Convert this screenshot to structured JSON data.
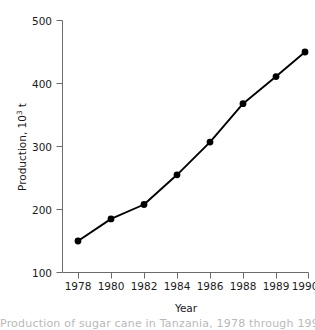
{
  "chart_data": {
    "type": "line",
    "title": "",
    "xlabel": "Year",
    "ylabel": "Production, 10",
    "ylabel_sup": "3",
    "ylabel_unit": " t",
    "x": [
      1978,
      1980,
      1982,
      1984,
      1986,
      1988,
      1989,
      1990
    ],
    "values": [
      150,
      185,
      208,
      255,
      307,
      368,
      411,
      450
    ],
    "categories": [
      "1978",
      "1980",
      "1982",
      "1984",
      "1986",
      "1988",
      "1989",
      "1990"
    ],
    "xtick_labels": [
      "1978",
      "1980",
      "1982",
      "1984",
      "1986",
      "1988",
      "1989",
      "1990"
    ],
    "ytick_labels": [
      "100",
      "200",
      "300",
      "400",
      "500"
    ],
    "ytick_values": [
      100,
      200,
      300,
      400,
      500
    ],
    "ylim": [
      100,
      500
    ],
    "grid": false,
    "legend": "none",
    "marker": "filled-circle",
    "line_color": "#000000",
    "marker_color": "#000000",
    "axis_color": "#6b6b6b",
    "background": "#ffffff"
  },
  "axes": {
    "y_title_text": "Production, 10",
    "y_title_sup": "3",
    "y_title_tail": " t",
    "x_title_text": "Year"
  },
  "ticks": {
    "y": [
      {
        "label": "500",
        "value": 500
      },
      {
        "label": "400",
        "value": 400
      },
      {
        "label": "300",
        "value": 300
      },
      {
        "label": "200",
        "value": 200
      },
      {
        "label": "100",
        "value": 100
      }
    ],
    "x": [
      {
        "label": "1978",
        "value": 1978
      },
      {
        "label": "1980",
        "value": 1980
      },
      {
        "label": "1982",
        "value": 1982
      },
      {
        "label": "1984",
        "value": 1984
      },
      {
        "label": "1986",
        "value": 1986
      },
      {
        "label": "1988",
        "value": 1988
      },
      {
        "label": "1989",
        "value": 1989
      },
      {
        "label": "1990",
        "value": 1990
      }
    ]
  },
  "caption": {
    "partial_text": "Production of sugar cane in Tanzania, 1978 through 1990."
  }
}
